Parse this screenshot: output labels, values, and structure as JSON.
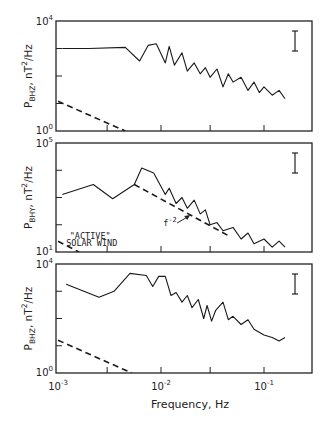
{
  "figure": {
    "x_axis_label": "Frequency, Hz",
    "x_ticks": [
      {
        "base": "10",
        "exp": "-3",
        "value": 0.001
      },
      {
        "base": "10",
        "exp": "-2",
        "value": 0.01
      },
      {
        "base": "10",
        "exp": "-1",
        "value": 0.1
      }
    ]
  },
  "chart_data": [
    {
      "type": "line",
      "title": "",
      "ylabel": "P_BHZ, nT^2/Hz",
      "ylabel_parts": {
        "main": "P",
        "sub": "BHZ",
        "rest": ", nT",
        "sup": "2",
        "tail": "/Hz"
      },
      "xlabel": "Frequency, Hz",
      "xscale": "log",
      "yscale": "log",
      "xlim": [
        0.001,
        0.2
      ],
      "ylim": [
        1,
        10000
      ],
      "y_tick_labels": [
        {
          "base": "10",
          "exp": "4"
        },
        {
          "base": "10",
          "exp": "0"
        }
      ],
      "grid": false,
      "error_bar": true,
      "series": [
        {
          "name": "observed spectrum",
          "style": "solid",
          "x": [
            0.0011,
            0.002,
            0.0045,
            0.0062,
            0.0075,
            0.009,
            0.011,
            0.012,
            0.0135,
            0.016,
            0.018,
            0.021,
            0.024,
            0.027,
            0.03,
            0.035,
            0.04,
            0.045,
            0.05,
            0.06,
            0.07,
            0.08,
            0.09,
            0.1,
            0.12,
            0.14,
            0.16
          ],
          "y": [
            1000,
            1000,
            1100,
            350,
            1300,
            1500,
            300,
            1200,
            250,
            700,
            150,
            300,
            120,
            200,
            90,
            180,
            40,
            120,
            60,
            90,
            30,
            60,
            25,
            40,
            20,
            30,
            15
          ]
        },
        {
          "name": "quiet solar wind reference",
          "style": "dashed",
          "x": [
            0.001,
            0.0045
          ],
          "y": [
            12,
            1
          ]
        }
      ]
    },
    {
      "type": "line",
      "title": "",
      "ylabel": "P_BHY, nT^2/Hz",
      "ylabel_parts": {
        "main": "P",
        "sub": "BHY",
        "rest": ", nT",
        "sup": "2",
        "tail": "/Hz"
      },
      "xlabel": "Frequency, Hz",
      "xscale": "log",
      "yscale": "log",
      "xlim": [
        0.001,
        0.2
      ],
      "ylim": [
        10,
        100000
      ],
      "y_tick_labels": [
        {
          "base": "10",
          "exp": "5"
        },
        {
          "base": "10",
          "exp": "1"
        }
      ],
      "grid": false,
      "error_bar": true,
      "annotations": [
        {
          "text": "\"ACTIVE\"",
          "at": [
            0.0013,
            30
          ]
        },
        {
          "text": "SOLAR WIND",
          "at": [
            0.0012,
            17
          ]
        },
        {
          "text": "f",
          "sup": "-2",
          "at": [
            0.0105,
            90
          ]
        }
      ],
      "series": [
        {
          "name": "observed spectrum",
          "style": "solid",
          "x": [
            0.0011,
            0.0022,
            0.0034,
            0.0055,
            0.0065,
            0.0085,
            0.011,
            0.012,
            0.014,
            0.016,
            0.018,
            0.021,
            0.024,
            0.027,
            0.03,
            0.035,
            0.04,
            0.05,
            0.06,
            0.07,
            0.08,
            0.1,
            0.12,
            0.14,
            0.16
          ],
          "y": [
            1300,
            3000,
            900,
            3000,
            12000,
            8000,
            1300,
            2200,
            600,
            1000,
            400,
            800,
            250,
            350,
            100,
            120,
            60,
            80,
            30,
            50,
            20,
            30,
            15,
            25,
            15
          ]
        },
        {
          "name": "f^-2 reference",
          "style": "dashed",
          "x": [
            0.0055,
            0.045
          ],
          "y": [
            3000,
            40
          ]
        },
        {
          "name": "active solar wind reference",
          "style": "dashed",
          "x": [
            0.001,
            0.0016
          ],
          "y": [
            25,
            10
          ]
        }
      ]
    },
    {
      "type": "line",
      "title": "",
      "ylabel": "P_BHZ, nT^2/Hz",
      "ylabel_parts": {
        "main": "P",
        "sub": "BHZ",
        "rest": ", nT",
        "sup": "2",
        "tail": "/Hz"
      },
      "xlabel": "Frequency, Hz",
      "xscale": "log",
      "yscale": "log",
      "xlim": [
        0.001,
        0.2
      ],
      "ylim": [
        1,
        10000
      ],
      "y_tick_labels": [
        {
          "base": "10",
          "exp": "4"
        },
        {
          "base": "10",
          "exp": "0"
        }
      ],
      "grid": false,
      "error_bar": true,
      "series": [
        {
          "name": "observed spectrum",
          "style": "solid",
          "x": [
            0.0012,
            0.0025,
            0.0035,
            0.005,
            0.0072,
            0.0083,
            0.0095,
            0.011,
            0.0125,
            0.014,
            0.016,
            0.018,
            0.02,
            0.023,
            0.026,
            0.028,
            0.031,
            0.034,
            0.04,
            0.045,
            0.05,
            0.06,
            0.07,
            0.08,
            0.1,
            0.12,
            0.14,
            0.16
          ],
          "y": [
            1800,
            600,
            1000,
            4500,
            3800,
            1500,
            3500,
            3500,
            700,
            900,
            400,
            700,
            250,
            500,
            100,
            300,
            80,
            200,
            400,
            90,
            120,
            60,
            90,
            40,
            25,
            20,
            15,
            20
          ]
        },
        {
          "name": "quiet solar wind reference",
          "style": "dashed",
          "x": [
            0.001,
            0.0052
          ],
          "y": [
            16,
            1
          ]
        }
      ]
    }
  ]
}
